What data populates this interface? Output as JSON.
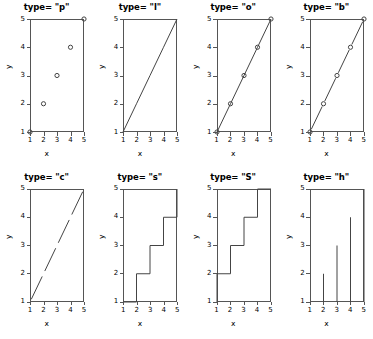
{
  "figure": {
    "rows": 2,
    "cols": 4,
    "line_color": "#444444",
    "box_color": "#555555",
    "background": "#ffffff"
  },
  "axes": {
    "xlabel": "x",
    "ylabel": "y",
    "xticks": [
      "1",
      "2",
      "3",
      "4",
      "5"
    ],
    "yticks": [
      "1",
      "2",
      "3",
      "4",
      "5"
    ],
    "xlim": [
      1,
      5
    ],
    "ylim": [
      1,
      5
    ]
  },
  "panels": [
    {
      "title": "type= \"p\"",
      "type_code": "p",
      "name": "panel-type-p"
    },
    {
      "title": "type= \"l\"",
      "type_code": "l",
      "name": "panel-type-l"
    },
    {
      "title": "type= \"o\"",
      "type_code": "o",
      "name": "panel-type-o"
    },
    {
      "title": "type= \"b\"",
      "type_code": "b",
      "name": "panel-type-b"
    },
    {
      "title": "type= \"c\"",
      "type_code": "c",
      "name": "panel-type-c"
    },
    {
      "title": "type= \"s\"",
      "type_code": "s",
      "name": "panel-type-s"
    },
    {
      "title": "type= \"S\"",
      "type_code": "S",
      "name": "panel-type-S"
    },
    {
      "title": "type= \"h\"",
      "type_code": "h",
      "name": "panel-type-h"
    }
  ],
  "chart_data": {
    "type": "line",
    "xlabel": "x",
    "ylabel": "y",
    "x": [
      1,
      2,
      3,
      4,
      5
    ],
    "xlim": [
      1,
      5
    ],
    "ylim": [
      1,
      5
    ],
    "grid": false,
    "legend": "none",
    "series": [
      {
        "name": "type= \"p\"",
        "plot_type": "p",
        "values": [
          1,
          2,
          3,
          4,
          5
        ]
      },
      {
        "name": "type= \"l\"",
        "plot_type": "l",
        "values": [
          1,
          2,
          3,
          4,
          5
        ]
      },
      {
        "name": "type= \"o\"",
        "plot_type": "o",
        "values": [
          1,
          2,
          3,
          4,
          5
        ]
      },
      {
        "name": "type= \"b\"",
        "plot_type": "b",
        "values": [
          1,
          2,
          3,
          4,
          5
        ]
      },
      {
        "name": "type= \"c\"",
        "plot_type": "c",
        "values": [
          1,
          2,
          3,
          4,
          5
        ]
      },
      {
        "name": "type= \"s\"",
        "plot_type": "s",
        "values": [
          1,
          2,
          3,
          4,
          5
        ]
      },
      {
        "name": "type= \"S\"",
        "plot_type": "S",
        "values": [
          1,
          2,
          3,
          4,
          5
        ]
      },
      {
        "name": "type= \"h\"",
        "plot_type": "h",
        "values": [
          1,
          2,
          3,
          4,
          5
        ]
      }
    ]
  }
}
